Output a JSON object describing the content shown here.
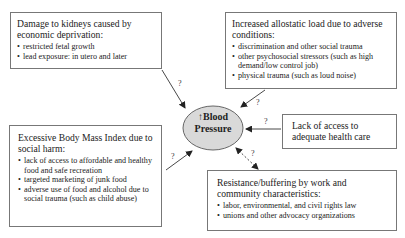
{
  "center": {
    "arrow_symbol": "↑",
    "line1": "Blood",
    "line2": "Pressure",
    "fill": "#d9d9d9"
  },
  "boxes": {
    "kidneys": {
      "title": "Damage to kidneys caused by economic deprivation:",
      "items": [
        "restricted fetal growth",
        "lead exposure: in utero and later"
      ]
    },
    "allostatic": {
      "title": "Increased allostatic load due to adverse conditions:",
      "items": [
        "discrimination and other social trauma",
        "other psychosocial stressors (such as high demand/low control job)",
        "physical trauma (such as loud noise)"
      ]
    },
    "healthcare": {
      "title": "Lack of access to adequate health care"
    },
    "bmi": {
      "title": "Excessive Body Mass Index due to social harm:",
      "items": [
        "lack of access to affordable and healthy food and safe recreation",
        "targeted marketing of junk food",
        "adverse use of food and alcohol due to social trauma (such as child abuse)"
      ]
    },
    "resistance": {
      "title": "Resistance/buffering by work and community characteristics:",
      "items": [
        "labor, environmental, and civil rights law",
        "unions and other advocacy organizations"
      ]
    }
  },
  "arrows": {
    "kidneys_label": "?",
    "allostatic_label": "?",
    "healthcare_label": "?",
    "bmi_label": "?",
    "resistance_label": "?"
  }
}
